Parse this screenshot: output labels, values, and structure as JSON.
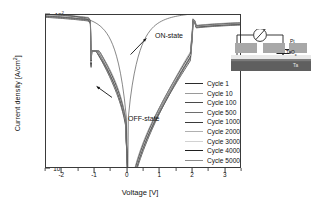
{
  "chart_data": {
    "type": "line",
    "title": "",
    "xlabel": "Voltage [V]",
    "ylabel": "Current density [A/cm²]",
    "xlim": [
      -2.5,
      3.5
    ],
    "ylim_exponents": [
      -4,
      2
    ],
    "yscale": "log",
    "xscale": "linear",
    "grid": false,
    "legend_position": "right-inside",
    "xticks": [
      "-2",
      "-1",
      "0",
      "1",
      "2",
      "3"
    ],
    "xtick_values": [
      -2,
      -1,
      0,
      1,
      2,
      3
    ],
    "ytick_mantissa": "10",
    "ytick_exponents": [
      "2",
      "1",
      "0",
      "-1",
      "-2",
      "-3",
      "-4"
    ],
    "annotations": [
      {
        "text": "ON-state",
        "x": 0.75,
        "y_exp": 1.35
      },
      {
        "text": "OFF-state",
        "x": 0.15,
        "y_exp": -1.15
      }
    ],
    "series": [
      {
        "name": "Cycle 1",
        "color": "#2b2b2b"
      },
      {
        "name": "Cycle 10",
        "color": "#9a9a9a"
      },
      {
        "name": "Cycle 100",
        "color": "#4a4a4a"
      },
      {
        "name": "Cycle 500",
        "color": "#6e6e6e"
      },
      {
        "name": "Cycle 1000",
        "color": "#3a3a3a"
      },
      {
        "name": "Cycle 2000",
        "color": "#b0b0b0"
      },
      {
        "name": "Cycle 3000",
        "color": "#d2d2d2"
      },
      {
        "name": "Cycle 4000",
        "color": "#1f1f1f"
      },
      {
        "name": "Cycle 5000",
        "color": "#8c8c8c"
      }
    ]
  },
  "axes": {
    "y_title": "Current density [A/cm",
    "y_title_sup": "2",
    "y_title_tail": "]",
    "x_title": "Voltage [V]"
  },
  "inset": {
    "name": "device-schematic",
    "meter_symbol": "⌀",
    "layers": [
      {
        "label": "Pt",
        "sub": ""
      },
      {
        "label": "TaO",
        "sub": "x"
      },
      {
        "label": "Ta",
        "sub": ""
      }
    ],
    "pt_label": "Pt",
    "taox_label": "TaO",
    "taox_sub": "x",
    "ta_label": "Ta"
  }
}
